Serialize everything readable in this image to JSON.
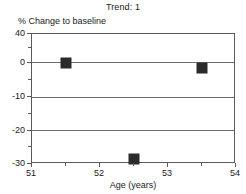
{
  "chart_data": {
    "type": "scatter",
    "title": "Trend: 1",
    "xlabel": "Age (years)",
    "ylabel": "% Change to baseline",
    "x": [
      51.5,
      52.5,
      53.5
    ],
    "values": [
      0,
      -28.5,
      -1.5
    ],
    "points": [
      {
        "x": 51.5,
        "y": 0
      },
      {
        "x": 52.5,
        "y": -28.5
      },
      {
        "x": 53.5,
        "y": -1.5
      }
    ],
    "xlim": [
      51,
      54
    ],
    "ylim": [
      -30,
      40
    ],
    "xticks": [
      51,
      52,
      53,
      54
    ],
    "xtick_labels": [
      "51",
      "52",
      "53",
      "54"
    ],
    "x_minor_ticks": [
      51.5,
      52.5,
      53.5
    ],
    "yticks": [
      40,
      0,
      -10,
      -20,
      -30
    ],
    "ytick_labels": [
      "40",
      "0",
      "-10",
      "-20",
      "-30"
    ],
    "y_minor_ticks": [
      20,
      -5,
      -15,
      -25
    ],
    "gridlines": [
      0,
      -10,
      -20
    ],
    "grid": true,
    "legend": null,
    "axis_note": "y-axis spacing is non-uniform: the 40-to-0 segment is compressed relative to the 10-unit steps below 0",
    "marker_color": "#2b2b2b",
    "axis_color": "#5a5a5a",
    "grid_color": "#6e6e6e",
    "background_color": "#ffffff"
  }
}
